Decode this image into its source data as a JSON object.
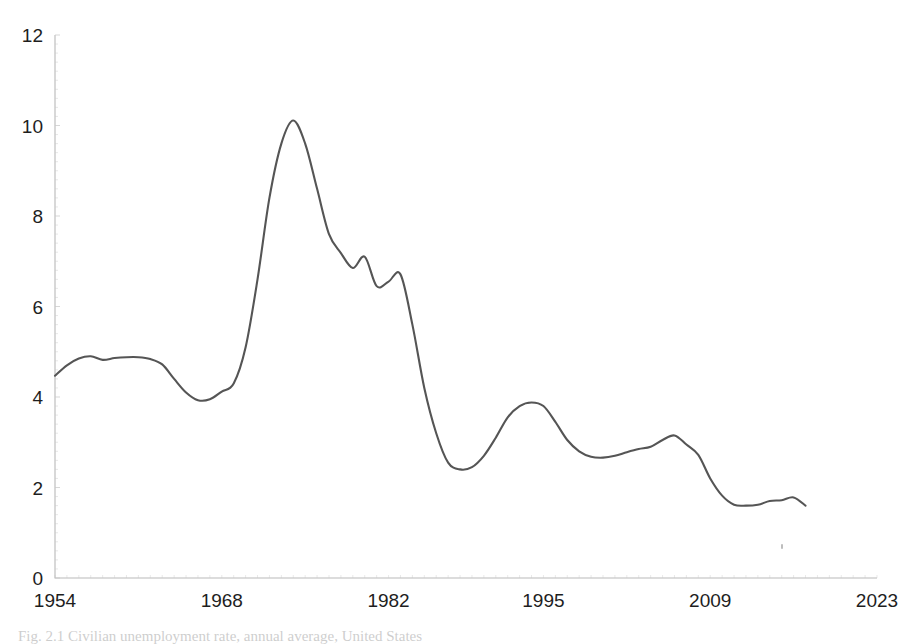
{
  "figure": {
    "background_color": "#ffffff",
    "line_color": "#555555",
    "axis_color": "#b9b9b9",
    "caption": "Fig. 2.1  Civilian unemployment rate, annual average, United States"
  },
  "chart_data": {
    "type": "line",
    "title": "",
    "subtitle": "",
    "xlabel": "",
    "ylabel": "",
    "grid": false,
    "legend": "none",
    "xlim": [
      1954,
      2023
    ],
    "ylim": [
      0,
      12
    ],
    "xticks": [
      1954,
      1968,
      1982,
      1995,
      2009,
      2023
    ],
    "xticklabels": [
      "1954",
      "1968",
      "1982",
      "1995",
      "2009",
      "2023"
    ],
    "yticks": [
      0,
      2,
      4,
      6,
      8,
      10,
      12
    ],
    "yticklabels": [
      "0",
      "2",
      "4",
      "6",
      "8",
      "10",
      "12"
    ],
    "series": [
      {
        "name": "unemployment-rate",
        "color": "#555555",
        "x": [
          1954,
          1955,
          1956,
          1957,
          1958,
          1959,
          1960,
          1961,
          1962,
          1963,
          1964,
          1965,
          1966,
          1967,
          1968,
          1969,
          1970,
          1971,
          1972,
          1973,
          1974,
          1975,
          1976,
          1977,
          1978,
          1979,
          1980,
          1981,
          1982,
          1983,
          1984,
          1985,
          1986,
          1987,
          1988,
          1989,
          1990,
          1991,
          1992,
          1993,
          1994,
          1995,
          1996,
          1997,
          1998,
          1999,
          2000,
          2001,
          2002,
          2003,
          2004,
          2005,
          2006,
          2007,
          2008,
          2009,
          2010,
          2011,
          2012,
          2013,
          2014,
          2015,
          2016,
          2017
        ],
        "values": [
          4.47,
          4.7,
          4.85,
          4.9,
          4.82,
          4.86,
          4.88,
          4.88,
          4.84,
          4.72,
          4.4,
          4.1,
          3.93,
          3.95,
          4.12,
          4.3,
          5.1,
          6.6,
          8.4,
          9.6,
          10.11,
          9.6,
          8.6,
          7.6,
          7.18,
          6.85,
          7.1,
          6.45,
          6.55,
          6.71,
          5.6,
          4.2,
          3.2,
          2.55,
          2.4,
          2.45,
          2.7,
          3.1,
          3.55,
          3.8,
          3.88,
          3.8,
          3.45,
          3.05,
          2.8,
          2.68,
          2.66,
          2.7,
          2.78,
          2.85,
          2.9,
          3.05,
          3.15,
          2.95,
          2.72,
          2.2,
          1.82,
          1.62,
          1.6,
          1.62,
          1.7,
          1.72,
          1.78,
          1.6
        ]
      }
    ]
  }
}
